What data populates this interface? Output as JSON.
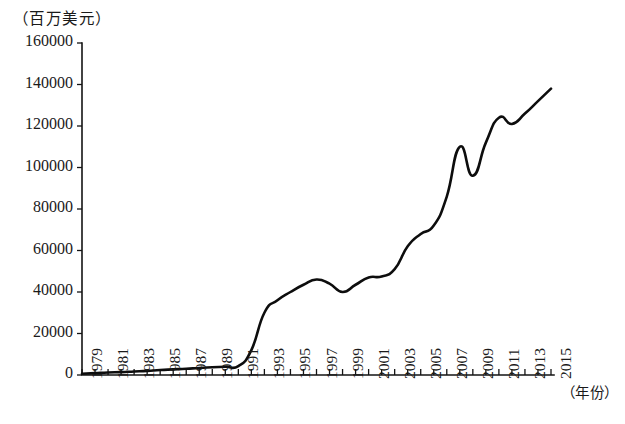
{
  "chart_data": {
    "type": "line",
    "title": "",
    "subtitle": "",
    "ylabel": "（百万美元）",
    "xlabel": "（年份）",
    "xlim": [
      1979,
      2015
    ],
    "ylim": [
      0,
      160000
    ],
    "grid": false,
    "legend": "none",
    "y_ticks": [
      0,
      20000,
      40000,
      60000,
      80000,
      100000,
      120000,
      140000,
      160000
    ],
    "y_tick_labels": [
      "0",
      "20000",
      "40000",
      "60000",
      "80000",
      "100000",
      "120000",
      "140000",
      "160000"
    ],
    "x_ticks": [
      1979,
      1981,
      1983,
      1985,
      1987,
      1989,
      1991,
      1993,
      1995,
      1997,
      1999,
      2001,
      2003,
      2005,
      2007,
      2009,
      2011,
      2013,
      2015
    ],
    "x_tick_labels": [
      "1979",
      "1981",
      "1983",
      "1985",
      "1987",
      "1989",
      "1991",
      "1993",
      "1995",
      "1997",
      "1999",
      "2001",
      "2003",
      "2005",
      "2007",
      "2009",
      "2011",
      "2013",
      "2015"
    ],
    "x_minor_ticks": [
      1980,
      1982,
      1984,
      1986,
      1988,
      1990,
      1992,
      1994,
      1996,
      1998,
      2000,
      2002,
      2004,
      2006,
      2008,
      2010,
      2012,
      2014
    ],
    "series": [
      {
        "name": "对外贸易额",
        "color": "#0d0d0d",
        "x": [
          1979,
          1980,
          1981,
          1982,
          1983,
          1984,
          1985,
          1986,
          1987,
          1988,
          1989,
          1990,
          1991,
          1992,
          1993,
          1994,
          1995,
          1996,
          1997,
          1998,
          1999,
          2000,
          2001,
          2002,
          2003,
          2004,
          2005,
          2006,
          2007,
          2008,
          2009,
          2010,
          2011,
          2012,
          2013,
          2014,
          2015
        ],
        "values": [
          600,
          900,
          1200,
          1400,
          1700,
          2000,
          2400,
          2700,
          3000,
          3400,
          3700,
          4000,
          4300,
          12000,
          30000,
          36000,
          40000,
          43500,
          46000,
          44000,
          40000,
          43500,
          47000,
          47500,
          51000,
          62000,
          68000,
          72000,
          86000,
          110000,
          96000,
          112000,
          124000,
          121000,
          126000,
          132000,
          138000
        ]
      }
    ]
  }
}
